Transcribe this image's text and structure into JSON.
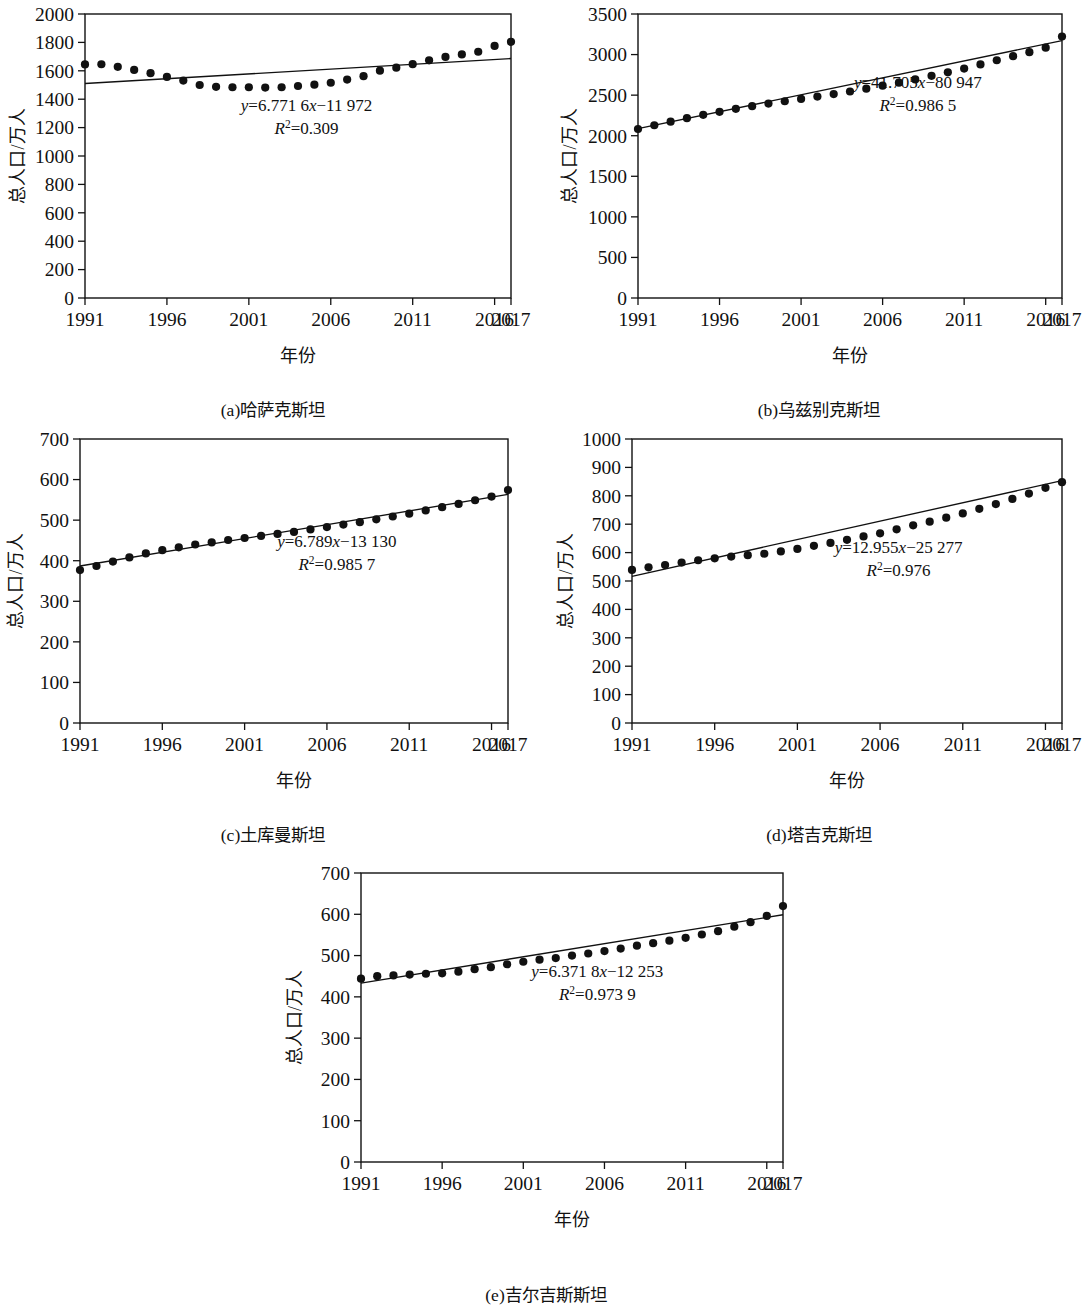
{
  "figure": {
    "axis_x_title": "年份",
    "axis_y_title": "总人口/万人"
  },
  "chart_data": [
    {
      "id": "a",
      "type": "scatter",
      "title": "(a)哈萨克斯坦",
      "caption": "(a)哈萨克斯坦",
      "xlabel": "年份",
      "ylabel": "总人口/万人",
      "equation": "y=6.771 6x−11 972",
      "r2": "R²=0.309",
      "eq_slope": 6.7716,
      "eq_intercept": -11972,
      "r2_value": 0.309,
      "xlim": [
        1991,
        2017
      ],
      "ylim": [
        0,
        2000
      ],
      "yticks": [
        0,
        200,
        400,
        600,
        800,
        1000,
        1200,
        1400,
        1600,
        1800,
        2000
      ],
      "xticks": [
        1991,
        1996,
        2001,
        2006,
        2011,
        2016,
        2017
      ],
      "xtick_labels": [
        "1991",
        "1996",
        "2001",
        "2006",
        "2011",
        "2016",
        "2017"
      ],
      "grid": false,
      "x": [
        1991,
        1992,
        1993,
        1994,
        1995,
        1996,
        1997,
        1998,
        1999,
        2000,
        2001,
        2002,
        2003,
        2004,
        2005,
        2006,
        2007,
        2008,
        2009,
        2010,
        2011,
        2012,
        2013,
        2014,
        2015,
        2016,
        2017
      ],
      "values": [
        1645,
        1646,
        1628,
        1606,
        1583,
        1557,
        1531,
        1500,
        1487,
        1484,
        1484,
        1482,
        1484,
        1493,
        1502,
        1516,
        1538,
        1562,
        1601,
        1622,
        1647,
        1674,
        1698,
        1715,
        1734,
        1775,
        1804
      ]
    },
    {
      "id": "b",
      "type": "scatter",
      "title": "(b)乌兹别克斯坦",
      "caption": "(b)乌兹别克斯坦",
      "xlabel": "年份",
      "ylabel": "总人口/万人",
      "equation": "y=41.705x−80 947",
      "r2": "R²=0.986 5",
      "eq_slope": 41.705,
      "eq_intercept": -80947,
      "r2_value": 0.9865,
      "xlim": [
        1991,
        2017
      ],
      "ylim": [
        0,
        3500
      ],
      "yticks": [
        0,
        500,
        1000,
        1500,
        2000,
        2500,
        3000,
        3500
      ],
      "xticks": [
        1991,
        1996,
        2001,
        2006,
        2011,
        2016,
        2017
      ],
      "xtick_labels": [
        "1991",
        "1996",
        "2001",
        "2006",
        "2011",
        "2016",
        "2017"
      ],
      "grid": false,
      "x": [
        1991,
        1992,
        1993,
        1994,
        1995,
        1996,
        1997,
        1998,
        1999,
        2000,
        2001,
        2002,
        2003,
        2004,
        2005,
        2006,
        2007,
        2008,
        2009,
        2010,
        2011,
        2012,
        2013,
        2014,
        2015,
        2016,
        2017
      ],
      "values": [
        2083,
        2129,
        2173,
        2216,
        2258,
        2295,
        2331,
        2364,
        2396,
        2425,
        2453,
        2482,
        2513,
        2545,
        2580,
        2617,
        2654,
        2694,
        2738,
        2781,
        2828,
        2878,
        2930,
        2980,
        3030,
        3085,
        3223
      ]
    },
    {
      "id": "c",
      "type": "scatter",
      "title": "(c)土库曼斯坦",
      "caption": "(c)土库曼斯坦",
      "xlabel": "年份",
      "ylabel": "总人口/万人",
      "equation": "y=6.789x−13 130",
      "r2": "R²=0.985 7",
      "eq_slope": 6.789,
      "eq_intercept": -13130,
      "r2_value": 0.9857,
      "xlim": [
        1991,
        2017
      ],
      "ylim": [
        0,
        700
      ],
      "yticks": [
        0,
        100,
        200,
        300,
        400,
        500,
        600,
        700
      ],
      "xticks": [
        1991,
        1996,
        2001,
        2006,
        2011,
        2016,
        2017
      ],
      "xtick_labels": [
        "1991",
        "1996",
        "2001",
        "2006",
        "2011",
        "2016",
        "2017"
      ],
      "grid": false,
      "x": [
        1991,
        1992,
        1993,
        1994,
        1995,
        1996,
        1997,
        1998,
        1999,
        2000,
        2001,
        2002,
        2003,
        2004,
        2005,
        2006,
        2007,
        2008,
        2009,
        2010,
        2011,
        2012,
        2013,
        2014,
        2015,
        2016,
        2017
      ],
      "values": [
        377,
        387,
        398,
        408,
        418,
        426,
        433,
        440,
        445,
        451,
        456,
        461,
        466,
        471,
        477,
        483,
        489,
        495,
        502,
        509,
        516,
        524,
        532,
        540,
        549,
        558,
        574
      ]
    },
    {
      "id": "d",
      "type": "scatter",
      "title": "(d)塔吉克斯坦",
      "caption": "(d)塔吉克斯坦",
      "xlabel": "年份",
      "ylabel": "总人口/万人",
      "equation": "y=12.955x−25 277",
      "r2": "R²=0.976",
      "eq_slope": 12.955,
      "eq_intercept": -25277,
      "r2_value": 0.976,
      "xlim": [
        1991,
        2017
      ],
      "ylim": [
        0,
        1000
      ],
      "yticks": [
        0,
        100,
        200,
        300,
        400,
        500,
        600,
        700,
        800,
        900,
        1000
      ],
      "xticks": [
        1991,
        1996,
        2001,
        2006,
        2011,
        2016,
        2017
      ],
      "xtick_labels": [
        "1991",
        "1996",
        "2001",
        "2006",
        "2011",
        "2016",
        "2017"
      ],
      "grid": false,
      "x": [
        1991,
        1992,
        1993,
        1994,
        1995,
        1996,
        1997,
        1998,
        1999,
        2000,
        2001,
        2002,
        2003,
        2004,
        2005,
        2006,
        2007,
        2008,
        2009,
        2010,
        2011,
        2012,
        2013,
        2014,
        2015,
        2016,
        2017
      ],
      "values": [
        539,
        548,
        556,
        565,
        573,
        580,
        586,
        591,
        596,
        604,
        613,
        624,
        634,
        645,
        657,
        668,
        682,
        696,
        709,
        723,
        738,
        754,
        771,
        789,
        808,
        828,
        848,
        890
      ]
    },
    {
      "id": "e",
      "type": "scatter",
      "title": "(e)吉尔吉斯斯坦",
      "caption": "(e)吉尔吉斯斯坦",
      "xlabel": "年份",
      "ylabel": "总人口/万人",
      "equation": "y=6.371 8x−12 253",
      "r2": "R²=0.973 9",
      "eq_slope": 6.3718,
      "eq_intercept": -12253,
      "r2_value": 0.9739,
      "xlim": [
        1991,
        2017
      ],
      "ylim": [
        0,
        700
      ],
      "yticks": [
        0,
        100,
        200,
        300,
        400,
        500,
        600,
        700
      ],
      "xticks": [
        1991,
        1996,
        2001,
        2006,
        2011,
        2016,
        2017
      ],
      "xtick_labels": [
        "1991",
        "1996",
        "2001",
        "2006",
        "2011",
        "2016",
        "2017"
      ],
      "grid": false,
      "x": [
        1991,
        1992,
        1993,
        1994,
        1995,
        1996,
        1997,
        1998,
        1999,
        2000,
        2001,
        2002,
        2003,
        2004,
        2005,
        2006,
        2007,
        2008,
        2009,
        2010,
        2011,
        2012,
        2013,
        2014,
        2015,
        2016,
        2017
      ],
      "values": [
        444,
        450,
        452,
        454,
        456,
        457,
        461,
        467,
        472,
        479,
        485,
        490,
        494,
        500,
        505,
        511,
        517,
        524,
        530,
        536,
        543,
        551,
        559,
        570,
        581,
        596,
        620
      ]
    }
  ]
}
